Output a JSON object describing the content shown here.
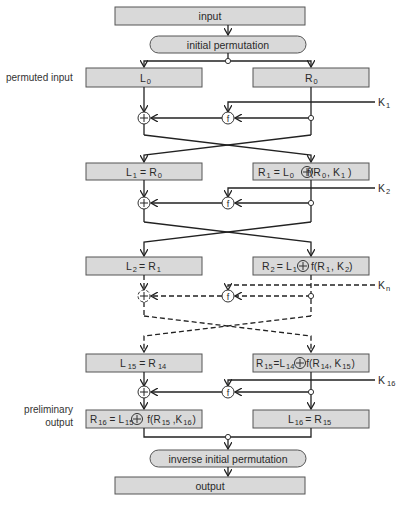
{
  "diagram": {
    "boxes": {
      "input": "input",
      "initial_permutation": "initial permutation",
      "inverse_initial_permutation": "inverse initial permutation",
      "output": "output"
    },
    "side_labels": {
      "permuted_input": "permuted input",
      "preliminary_output_1": "preliminary",
      "preliminary_output_2": "output"
    },
    "rounds": [
      {
        "left": "L0",
        "right": "R0",
        "key": "K1"
      },
      {
        "left": "L1 = R0",
        "right": "R1 = L0 ⊕ f(R0, K1)",
        "key": "K2"
      },
      {
        "left": "L2 = R1",
        "right": "R2 = L1 ⊕ f(R1, K2)",
        "key": "Kn"
      },
      {
        "left": "L15 = R14",
        "right": "R15 = L14 ⊕ f(R14, K15)",
        "key": "K16"
      },
      {
        "left": "R16 = L15 ⊕ f(R15, K16)",
        "right": "L16 = R15"
      }
    ],
    "operators": {
      "xor": "+",
      "function": "f"
    },
    "colors": {
      "box_fill": "#d9d9d9",
      "box_stroke": "#555555",
      "line": "#222222"
    }
  },
  "text": {
    "L": "L",
    "R": "R",
    "K": "K",
    "eq": "=",
    "f": "f",
    "s0": "0",
    "s1": "1",
    "s2": "2",
    "sn": "n",
    "s14": "14",
    "s15": "15",
    "s16": "16",
    "fR0K1_a": "f(R",
    "fR0K1_b": ", K",
    "fR0K1_c": " )",
    "fR1K2_a": "f(R",
    "fR1K2_b": ", K",
    "fR1K2_c": ")",
    "fR14K15_a": "f(R",
    "fR14K15_b": ", K",
    "fR14K15_c": ")",
    "fR15K16_a": "f(R",
    "fR15K16_b": " ,K",
    "fR15K16_c": ")"
  }
}
